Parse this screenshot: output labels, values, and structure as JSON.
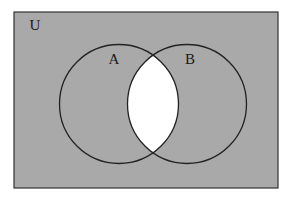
{
  "diagram": {
    "type": "venn",
    "universe": {
      "label": "U",
      "x": 14,
      "y": 12,
      "width": 264,
      "height": 176,
      "label_x": 35,
      "label_y": 30,
      "fill": "#a9a9a9",
      "stroke": "#333333"
    },
    "sets": [
      {
        "id": "A",
        "label": "A",
        "cx": 119,
        "cy": 104,
        "r": 59.5,
        "label_x": 114,
        "label_y": 64
      },
      {
        "id": "B",
        "label": "B",
        "cx": 187,
        "cy": 104,
        "r": 59.5,
        "label_x": 190,
        "label_y": 64
      }
    ],
    "shaded_region": "complement of (A ∩ B)",
    "unshaded_region": "A ∩ B",
    "colors": {
      "shaded": "#a9a9a9",
      "unshaded": "#ffffff",
      "outline": "#222222"
    }
  }
}
